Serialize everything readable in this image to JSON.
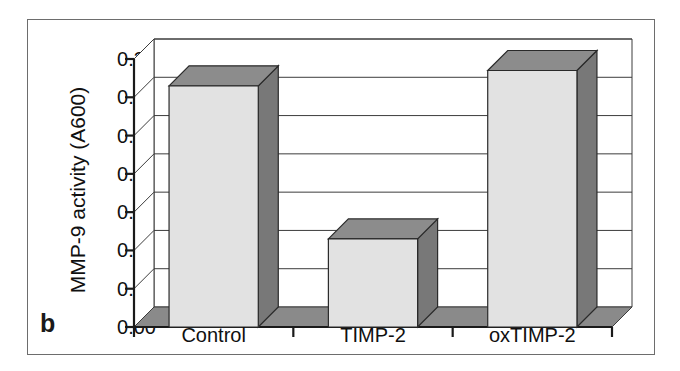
{
  "figure": {
    "panel_letter": "b"
  },
  "chart_data": {
    "type": "bar",
    "title": "",
    "subtitle": "",
    "xlabel": "",
    "ylabel": "MMP-9 activity (A600)",
    "categories": [
      "Control",
      "TIMP-2",
      "oxTIMP-2"
    ],
    "values": [
      0.315,
      0.115,
      0.335
    ],
    "series": [
      {
        "name": "MMP-9 activity",
        "values": [
          0.315,
          0.115,
          0.335
        ]
      }
    ],
    "ylim": [
      0.0,
      0.35
    ],
    "ytick_values": [
      0.0,
      0.05,
      0.1,
      0.15,
      0.2,
      0.25,
      0.3,
      0.35
    ],
    "ytick_labels": [
      "0.00",
      "0.05",
      "0.10",
      "0.15",
      "0.20",
      "0.25",
      "0.30",
      "0.35"
    ],
    "grid": "horizontal-only",
    "legend": "none",
    "style": "3d-column",
    "annotations": []
  },
  "colors": {
    "bar_front": "#e2e2e2",
    "bar_side": "#787878",
    "bar_top": "#8c8c8c",
    "floor": "#8a8a8a",
    "axis_line": "#1a1a1a",
    "grid_line": "#3c3c3c",
    "frame": "#6d6d6d",
    "text": "#101010",
    "background": "#ffffff"
  }
}
